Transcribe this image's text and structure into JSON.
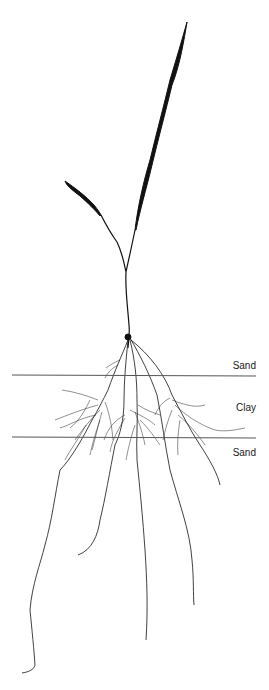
{
  "figure": {
    "layers": [
      {
        "label": "Sand",
        "boundary_y": 375
      },
      {
        "label": "Clay",
        "boundary_y": 437
      },
      {
        "label": "Sand"
      }
    ],
    "colors": {
      "ink": "#111111",
      "boundary": "#555555",
      "background": "#ffffff"
    }
  }
}
